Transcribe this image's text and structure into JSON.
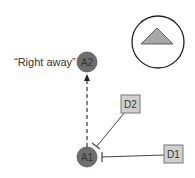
{
  "diagram": {
    "annotation": "“Right away”",
    "nodes": {
      "a1": {
        "label": "A1",
        "color": "#6e6e6e"
      },
      "a2": {
        "label": "A2",
        "color": "#6e6e6e"
      },
      "d1": {
        "label": "D1",
        "color": "#cfcfcf"
      },
      "d2": {
        "label": "D2",
        "color": "#cfcfcf"
      }
    },
    "legend_symbol": {
      "shape": "triangle-in-circle",
      "fill": "#a8a8a8"
    },
    "edges": [
      {
        "from": "A1",
        "to": "A2",
        "style": "dashed-arrow"
      },
      {
        "from": "D2",
        "to": "A1",
        "style": "inhibition"
      },
      {
        "from": "D1",
        "to": "A1",
        "style": "inhibition"
      }
    ]
  }
}
